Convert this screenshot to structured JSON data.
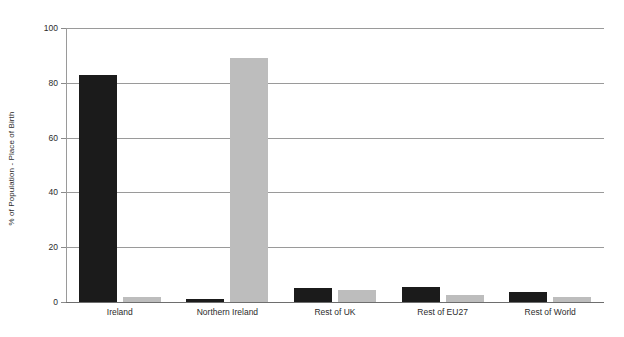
{
  "chart_data": {
    "type": "bar",
    "title": "",
    "subtitle": "",
    "xlabel": "",
    "ylabel": "% of Population - Place of Birth",
    "ylim": [
      0,
      100
    ],
    "yticks": [
      0,
      20,
      40,
      60,
      80,
      100
    ],
    "ytick_labels": [
      "0",
      "20",
      "40",
      "60",
      "80",
      "100"
    ],
    "grid": "horizontal",
    "legend": "none",
    "categories": [
      "Ireland",
      "Northern Ireland",
      "Rest of UK",
      "Rest of EU27",
      "Rest of World"
    ],
    "series": [
      {
        "name": "Series A",
        "color": "#1b1b1b",
        "values": [
          83,
          1,
          5,
          5.5,
          3.5
        ]
      },
      {
        "name": "Series B",
        "color": "#bdbdbd",
        "values": [
          2,
          89,
          4.5,
          2.5,
          1.8
        ]
      }
    ]
  },
  "axes": {
    "y_title": "% of Population - Place of Birth"
  },
  "colors": {
    "series_a": "#1b1b1b",
    "series_b": "#bdbdbd",
    "grid": "#9a9a9a",
    "axis": "#6e6e6e",
    "text": "#2b2b2b",
    "background": "#ffffff"
  }
}
